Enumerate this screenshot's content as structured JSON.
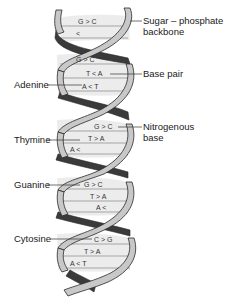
{
  "diagram": {
    "labels_right": [
      {
        "id": "sugar-phosphate-backbone",
        "line1": "Sugar – phosphate",
        "line2": "backbone",
        "x": 143,
        "y": 16
      },
      {
        "id": "base-pair",
        "line1": "Base pair",
        "line2": "",
        "x": 143,
        "y": 70
      },
      {
        "id": "nitrogenous-base",
        "line1": "Nitrogenous",
        "line2": "base",
        "x": 143,
        "y": 122
      }
    ],
    "labels_left": [
      {
        "id": "adenine",
        "text": "Adenine",
        "x": 14,
        "y": 80
      },
      {
        "id": "thymine",
        "text": "Thymine",
        "x": 14,
        "y": 135
      },
      {
        "id": "guanine",
        "text": "Guanine",
        "x": 14,
        "y": 180
      },
      {
        "id": "cytosine",
        "text": "Cytosine",
        "x": 14,
        "y": 234
      }
    ],
    "base_pairs": [
      {
        "left": "G",
        "bond": ">",
        "right": "C",
        "y": 22
      },
      {
        "left": "",
        "bond": "<",
        "right": "",
        "y": 34
      },
      {
        "left": "G",
        "bond": ">",
        "right": "C",
        "y": 60
      },
      {
        "left": "T",
        "bond": "<",
        "right": "A",
        "y": 74
      },
      {
        "left": "A",
        "bond": "<",
        "right": "T",
        "y": 87
      },
      {
        "left": "G",
        "bond": ">",
        "right": "C",
        "y": 127
      },
      {
        "left": "T",
        "bond": ">",
        "right": "A",
        "y": 139
      },
      {
        "left": "A",
        "bond": "<",
        "right": "",
        "y": 150
      },
      {
        "left": "G",
        "bond": ">",
        "right": "C",
        "y": 185
      },
      {
        "left": "T",
        "bond": ">",
        "right": "A",
        "y": 197
      },
      {
        "left": "A",
        "bond": "<",
        "right": "",
        "y": 208
      },
      {
        "left": "C",
        "bond": ">",
        "right": "G",
        "y": 240
      },
      {
        "left": "T",
        "bond": ">",
        "right": "A",
        "y": 252
      },
      {
        "left": "A",
        "bond": "<",
        "right": "T",
        "y": 264
      }
    ],
    "colors": {
      "backbone_light": "#c8c8c8",
      "backbone_dark": "#3a3a3a",
      "rung_fill": "#ececec",
      "outline": "#2a2a2a",
      "text": "#1a1a1a"
    }
  }
}
